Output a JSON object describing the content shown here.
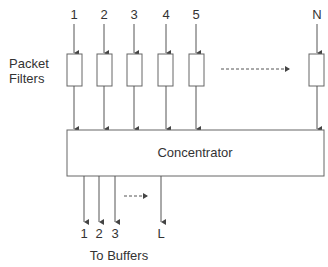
{
  "diagram": {
    "inputs": [
      {
        "label": "1",
        "x": 74
      },
      {
        "label": "2",
        "x": 104
      },
      {
        "label": "3",
        "x": 134
      },
      {
        "label": "4",
        "x": 166
      },
      {
        "label": "5",
        "x": 196
      },
      {
        "label": "N",
        "x": 317
      }
    ],
    "filters_label_line1": "Packet",
    "filters_label_line2": "Filters",
    "concentrator_label": "Concentrator",
    "outputs": [
      {
        "label": "1",
        "x": 84
      },
      {
        "label": "2",
        "x": 99
      },
      {
        "label": "3",
        "x": 115
      },
      {
        "label": "L",
        "x": 161
      }
    ],
    "outputs_caption": "To Buffers",
    "line_color": "#555555"
  }
}
